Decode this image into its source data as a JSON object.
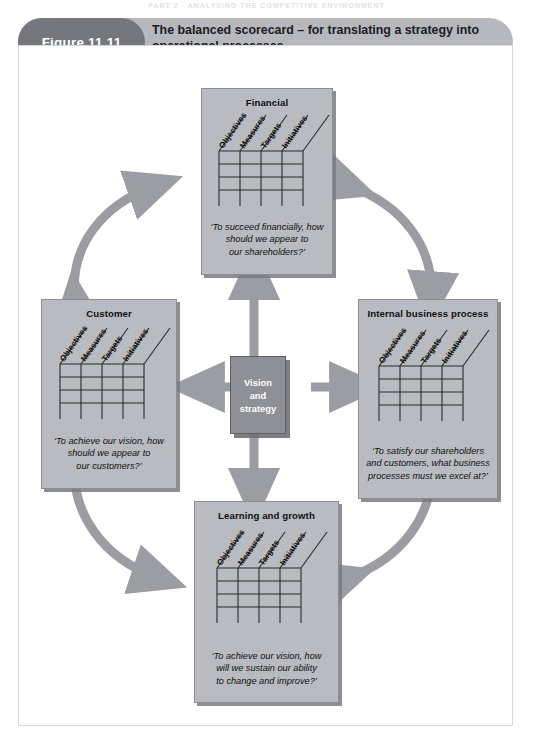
{
  "running_head": "PART 2  ·  ANALYSING THE COMPETITIVE ENVIRONMENT",
  "figure": {
    "number_label": "Figure 11.11",
    "title": "The balanced scorecard – for translating a strategy into operational processes"
  },
  "center": {
    "line1": "Vision",
    "line2": "and",
    "line3": "strategy"
  },
  "matrix_columns": [
    "Objectives",
    "Measures",
    "Targets",
    "Initiatives"
  ],
  "matrix_rows": 4,
  "perspectives": [
    {
      "id": "financial",
      "title": "Financial",
      "caption_lines": [
        "‘To succeed financially, how",
        "should we appear to",
        "our shareholders?’"
      ]
    },
    {
      "id": "customer",
      "title": "Customer",
      "caption_lines": [
        "‘To achieve our vision, how",
        "should we appear to",
        "our customers?’"
      ]
    },
    {
      "id": "internal-business-process",
      "title": "Internal business process",
      "caption_lines": [
        "‘To satisfy our shareholders",
        "and customers, what business",
        "processes must we excel at?’"
      ]
    },
    {
      "id": "learning-and-growth",
      "title": "Learning and growth",
      "caption_lines": [
        "‘To achieve our vision, how",
        "will we sustain our ability",
        "to change and improve?’"
      ]
    }
  ],
  "colors": {
    "header_bar": "#b6b8bd",
    "header_pill": "#76777c",
    "box_fill": "#b9bbc0",
    "box_border": "#8c8e93",
    "center_fill": "#8e9095",
    "arrow": "#9b9da2",
    "frame_border": "#d8d9dd",
    "text": "#101012"
  }
}
